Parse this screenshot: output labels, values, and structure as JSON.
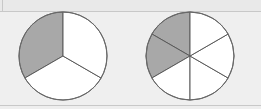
{
  "figure": {
    "canvas": {
      "width": 261,
      "height": 109
    },
    "background_color": "#EFEFEF",
    "rule_color": "#C8C8C8",
    "shaded_color": "#A8A8A8",
    "unshaded_color": "#FFFFFF",
    "stroke_color": "#5A5A5A",
    "rules": [
      {
        "name": "top-rule",
        "y": 11
      },
      {
        "name": "bottom-rule",
        "y": 105
      }
    ]
  },
  "chart_data": [
    {
      "type": "pie",
      "name": "circle-thirds",
      "title": "",
      "center": {
        "x": 63,
        "y": 56
      },
      "radius": 44,
      "total_sectors": 3,
      "shaded_sectors": 1,
      "fraction_label": "1/3",
      "fraction_value": 0.3333,
      "start_angle_deg": -90,
      "sector_span_deg": 120,
      "categories": [
        "sector-1",
        "sector-2",
        "sector-3"
      ],
      "values": [
        120,
        120,
        120
      ],
      "shaded": [
        true,
        false,
        false
      ],
      "sector_order": "counterclockwise from 12 o'clock",
      "legend": "none",
      "grid": false
    },
    {
      "type": "pie",
      "name": "circle-sixths",
      "title": "",
      "center": {
        "x": 190,
        "y": 56
      },
      "radius": 44,
      "total_sectors": 6,
      "shaded_sectors": 2,
      "fraction_label": "2/6",
      "fraction_value": 0.3333,
      "start_angle_deg": -90,
      "sector_span_deg": 60,
      "categories": [
        "sector-1",
        "sector-2",
        "sector-3",
        "sector-4",
        "sector-5",
        "sector-6"
      ],
      "values": [
        60,
        60,
        60,
        60,
        60,
        60
      ],
      "shaded": [
        true,
        true,
        false,
        false,
        false,
        false
      ],
      "sector_order": "counterclockwise from 12 o'clock",
      "legend": "none",
      "grid": false
    }
  ]
}
